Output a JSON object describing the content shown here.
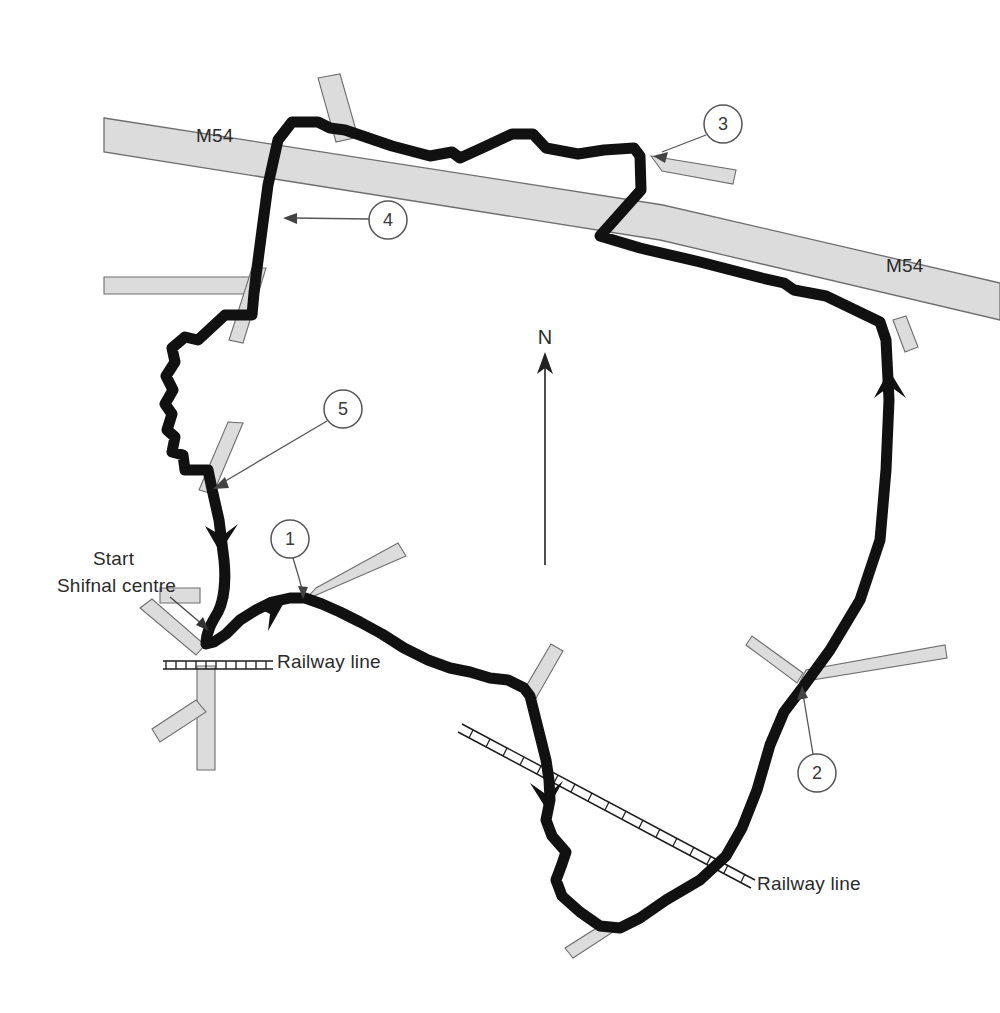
{
  "map": {
    "title": "Shifnal circular cycle route map",
    "background_color": "#ffffff",
    "route_color": "#111111",
    "road_fill": "#dcdcdc",
    "road_stroke": "#6e6e6e",
    "marker_stroke": "#555555",
    "text_color": "#2b2b2b",
    "width": 1000,
    "height": 1013
  },
  "labels": {
    "motorway_left": "M54",
    "motorway_right": "M54",
    "start": "Start",
    "shifnal_centre": "Shifnal centre",
    "railway_line_top": "Railway line",
    "railway_line_bottom": "Railway line",
    "north": "N"
  },
  "markers": [
    {
      "id": "1",
      "label": "1",
      "cx": 290,
      "cy": 539,
      "r": 19,
      "target_x": 303,
      "target_y": 597
    },
    {
      "id": "2",
      "label": "2",
      "cx": 817,
      "cy": 773,
      "r": 19,
      "target_x": 803,
      "target_y": 687
    },
    {
      "id": "3",
      "label": "3",
      "cx": 723,
      "cy": 124,
      "r": 19,
      "target_x": 655,
      "target_y": 155
    },
    {
      "id": "4",
      "label": "4",
      "cx": 388,
      "cy": 220,
      "r": 19,
      "target_x": 284,
      "target_y": 218
    },
    {
      "id": "5",
      "label": "5",
      "cx": 343,
      "cy": 409,
      "r": 19,
      "target_x": 212,
      "target_y": 489
    }
  ],
  "north_arrow": {
    "label": "N",
    "x": 545,
    "tip_y": 355,
    "tail_y": 565,
    "label_y": 345
  },
  "label_positions": {
    "motorway_left": {
      "x": 196,
      "y": 142
    },
    "motorway_right": {
      "x": 886,
      "y": 272
    },
    "start": {
      "x": 93,
      "y": 565
    },
    "shifnal_centre": {
      "x": 57,
      "y": 592
    },
    "railway_line_top": {
      "x": 277,
      "y": 668
    },
    "railway_line_bottom": {
      "x": 757,
      "y": 890
    }
  },
  "features": {
    "route_type": "circular-cycle-route",
    "direction_arrows": 4,
    "railway_count": 2,
    "motorway_count": 1,
    "minor_road_count": 11
  }
}
